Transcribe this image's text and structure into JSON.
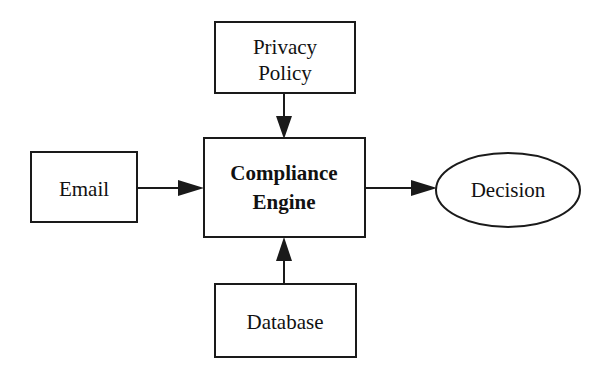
{
  "diagram": {
    "background_color": "#ffffff",
    "stroke_color": "#1a1a1a",
    "text_color": "#111111",
    "nodes": [
      {
        "id": "privacy-policy",
        "shape": "rectangle",
        "label_line1": "Privacy",
        "label_line2": "Policy",
        "bold": false,
        "x": 215,
        "y": 22,
        "width": 140,
        "height": 71
      },
      {
        "id": "email",
        "shape": "rectangle",
        "label_line1": "Email",
        "label_line2": "",
        "bold": false,
        "x": 31,
        "y": 152,
        "width": 106,
        "height": 70
      },
      {
        "id": "compliance-engine",
        "shape": "rectangle",
        "label_line1": "Compliance",
        "label_line2": "Engine",
        "bold": true,
        "x": 204,
        "y": 138,
        "width": 161,
        "height": 99
      },
      {
        "id": "database",
        "shape": "rectangle",
        "label_line1": "Database",
        "label_line2": "",
        "bold": false,
        "x": 215,
        "y": 284,
        "width": 141,
        "height": 73
      },
      {
        "id": "decision",
        "shape": "ellipse",
        "label_line1": "Decision",
        "label_line2": "",
        "bold": false,
        "cx": 508,
        "cy": 190,
        "rx": 72,
        "ry": 37
      }
    ],
    "edges": [
      {
        "id": "privacy-policy-to-compliance-engine",
        "from": "privacy-policy",
        "to": "compliance-engine",
        "direction": "down",
        "label": ""
      },
      {
        "id": "email-to-compliance-engine",
        "from": "email",
        "to": "compliance-engine",
        "direction": "right",
        "label": ""
      },
      {
        "id": "database-to-compliance-engine",
        "from": "database",
        "to": "compliance-engine",
        "direction": "up",
        "label": ""
      },
      {
        "id": "compliance-engine-to-decision",
        "from": "compliance-engine",
        "to": "decision",
        "direction": "right",
        "label": ""
      }
    ]
  }
}
